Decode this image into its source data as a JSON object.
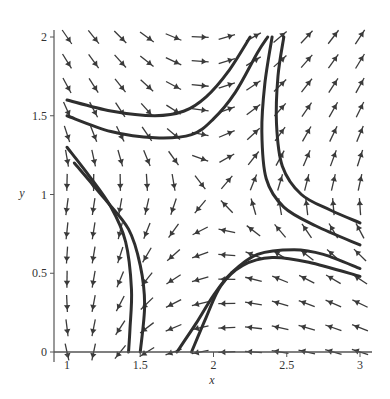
{
  "chart_data": {
    "type": "vector_field",
    "title": "",
    "xlabel": "x",
    "ylabel": "y",
    "xlim": [
      1,
      3
    ],
    "ylim": [
      0,
      2
    ],
    "xticks": [
      {
        "value": 1,
        "label": "1"
      },
      {
        "value": 1.5,
        "label": "1.5"
      },
      {
        "value": 2,
        "label": "2"
      },
      {
        "value": 2.5,
        "label": "2.5"
      },
      {
        "value": 3,
        "label": "3"
      }
    ],
    "yticks": [
      {
        "value": 0,
        "label": "0"
      },
      {
        "value": 0.5,
        "label": "0.5"
      },
      {
        "value": 1,
        "label": "1"
      },
      {
        "value": 1.5,
        "label": "1.5"
      },
      {
        "value": 2,
        "label": "2"
      }
    ],
    "grid": false,
    "equilibrium": {
      "x": 2,
      "y": 1,
      "type": "saddle"
    },
    "arrow_grid": {
      "nx": 12,
      "ny": 14
    },
    "field_description": "Saddle-type direction field: arrows point right in upper-left, up on the right side, down in lower-left, left in lower-right.",
    "trajectories": [
      {
        "name": "upper-left-1",
        "points": [
          [
            1.0,
            1.6
          ],
          [
            1.3,
            1.53
          ],
          [
            1.6,
            1.5
          ],
          [
            1.8,
            1.53
          ],
          [
            1.95,
            1.62
          ],
          [
            2.1,
            1.78
          ],
          [
            2.25,
            2.0
          ]
        ]
      },
      {
        "name": "upper-left-2",
        "points": [
          [
            1.0,
            1.5
          ],
          [
            1.3,
            1.4
          ],
          [
            1.6,
            1.36
          ],
          [
            1.85,
            1.38
          ],
          [
            2.0,
            1.48
          ],
          [
            2.15,
            1.65
          ],
          [
            2.3,
            1.9
          ],
          [
            2.37,
            2.0
          ]
        ]
      },
      {
        "name": "left-1",
        "points": [
          [
            1.0,
            1.3
          ],
          [
            1.15,
            1.12
          ],
          [
            1.3,
            0.92
          ],
          [
            1.4,
            0.7
          ],
          [
            1.44,
            0.4
          ],
          [
            1.43,
            0.15
          ],
          [
            1.42,
            0.0
          ]
        ]
      },
      {
        "name": "left-2",
        "points": [
          [
            1.05,
            1.2
          ],
          [
            1.25,
            0.98
          ],
          [
            1.42,
            0.78
          ],
          [
            1.5,
            0.55
          ],
          [
            1.53,
            0.3
          ],
          [
            1.5,
            0.0
          ]
        ]
      },
      {
        "name": "right-1",
        "points": [
          [
            2.4,
            2.0
          ],
          [
            2.35,
            1.7
          ],
          [
            2.33,
            1.4
          ],
          [
            2.36,
            1.1
          ],
          [
            2.48,
            0.92
          ],
          [
            2.7,
            0.8
          ],
          [
            3.0,
            0.68
          ]
        ]
      },
      {
        "name": "right-2",
        "points": [
          [
            2.48,
            2.0
          ],
          [
            2.44,
            1.75
          ],
          [
            2.43,
            1.45
          ],
          [
            2.47,
            1.18
          ],
          [
            2.6,
            1.0
          ],
          [
            2.8,
            0.9
          ],
          [
            3.0,
            0.82
          ]
        ]
      },
      {
        "name": "lower-right-1",
        "points": [
          [
            1.85,
            0.0
          ],
          [
            1.95,
            0.22
          ],
          [
            2.05,
            0.42
          ],
          [
            2.2,
            0.55
          ],
          [
            2.4,
            0.6
          ],
          [
            2.65,
            0.57
          ],
          [
            3.0,
            0.48
          ]
        ]
      },
      {
        "name": "lower-right-2",
        "points": [
          [
            1.75,
            0.0
          ],
          [
            1.88,
            0.18
          ],
          [
            2.0,
            0.36
          ],
          [
            2.12,
            0.5
          ],
          [
            2.3,
            0.62
          ],
          [
            2.55,
            0.65
          ],
          [
            2.75,
            0.62
          ],
          [
            3.0,
            0.53
          ]
        ]
      }
    ]
  },
  "axes": {
    "x_label": "x",
    "y_label": "y"
  },
  "colors": {
    "arrow": "#3a3a3a",
    "trajectory": "#2e2e2e",
    "axis": "#555555",
    "background": "#ffffff"
  }
}
